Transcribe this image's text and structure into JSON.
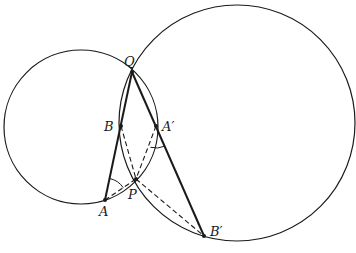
{
  "diagram": {
    "title": "",
    "colors": {
      "stroke": "#1a1a1a",
      "background": "#ffffff"
    },
    "circles": [
      {
        "name": "left-circle",
        "cx": 81,
        "cy": 127,
        "r": 77
      },
      {
        "name": "right-circle",
        "cx": 237,
        "cy": 123,
        "r": 118
      }
    ],
    "points": {
      "Q": {
        "label": "Q",
        "x": 132,
        "y": 72
      },
      "B": {
        "label": "B",
        "x": 121,
        "y": 126
      },
      "A_prime": {
        "label": "A′",
        "x": 156,
        "y": 126
      },
      "P": {
        "label": "P",
        "x": 136,
        "y": 179
      },
      "A": {
        "label": "A",
        "x": 105,
        "y": 200
      },
      "B_prime": {
        "label": "B′",
        "x": 204,
        "y": 236
      }
    },
    "solid_segments": [
      [
        "A",
        "Q"
      ],
      [
        "Q",
        "B_prime"
      ]
    ],
    "dashed_segments": [
      [
        "A",
        "P"
      ],
      [
        "B",
        "P"
      ],
      [
        "A_prime",
        "P"
      ],
      [
        "P",
        "B_prime"
      ]
    ],
    "angle_marks": [
      {
        "vertex": "A",
        "between": [
          "B",
          "P"
        ]
      },
      {
        "vertex": "A_prime",
        "between": [
          "B_prime",
          "P"
        ]
      }
    ]
  }
}
